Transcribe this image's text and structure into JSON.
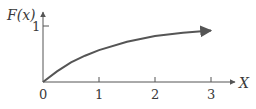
{
  "chart_data": {
    "type": "line",
    "title": "",
    "ylabel": "F(x)",
    "xlabel": "X",
    "x_ticks": [
      "0",
      "1",
      "2",
      "3"
    ],
    "y_ticks": [
      "1"
    ],
    "xlim": [
      0,
      3.3
    ],
    "ylim": [
      0,
      1.2
    ],
    "grid": false,
    "legend": null,
    "series": [
      {
        "name": "F(x)",
        "x": [
          0,
          0.25,
          0.5,
          0.75,
          1,
          1.5,
          2,
          2.5,
          3
        ],
        "values": [
          0,
          0.19,
          0.35,
          0.47,
          0.57,
          0.72,
          0.82,
          0.88,
          0.92
        ],
        "end_arrow": true
      }
    ],
    "colors": {
      "curve": "#555555",
      "axes": "#555555",
      "text": "#3a3a3a"
    }
  }
}
